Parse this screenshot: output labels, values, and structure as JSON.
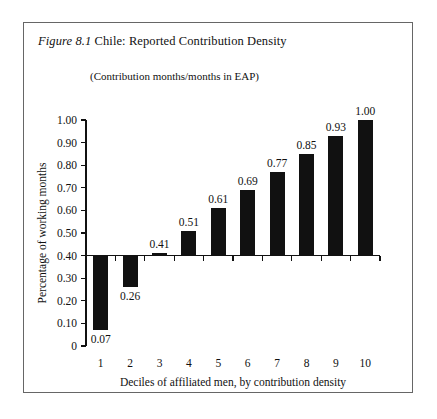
{
  "figure": {
    "number_label": "Figure 8.1",
    "title_text": " Chile: Reported Contribution Density",
    "subtitle": "(Contribution months/months in EAP)"
  },
  "chart_data": {
    "type": "bar",
    "title": "Figure 8.1 Chile: Reported Contribution Density",
    "subtitle": "(Contribution months/months in EAP)",
    "xlabel": "Deciles of affiliated men, by contribution density",
    "ylabel": "Percentage of working months",
    "categories": [
      "1",
      "2",
      "3",
      "4",
      "5",
      "6",
      "7",
      "8",
      "9",
      "10"
    ],
    "values": [
      0.07,
      0.26,
      0.41,
      0.51,
      0.61,
      0.69,
      0.77,
      0.85,
      0.93,
      1.0
    ],
    "value_labels": [
      "0.07",
      "0.26",
      "0.41",
      "0.51",
      "0.61",
      "0.69",
      "0.77",
      "0.85",
      "0.93",
      "1.00"
    ],
    "baseline": 0.4,
    "ylim": [
      0,
      1.0
    ],
    "ytick_values": [
      0,
      0.1,
      0.2,
      0.3,
      0.4,
      0.5,
      0.6,
      0.7,
      0.8,
      0.9,
      1.0
    ],
    "ytick_labels": [
      "0",
      "0.10",
      "0.20",
      "0.30",
      "0.40",
      "0.50",
      "0.60",
      "0.70",
      "0.80",
      "0.90",
      "1.00"
    ],
    "grid": false,
    "legend": null,
    "bar_color": "#111111",
    "series_name": "Reported contribution density"
  }
}
